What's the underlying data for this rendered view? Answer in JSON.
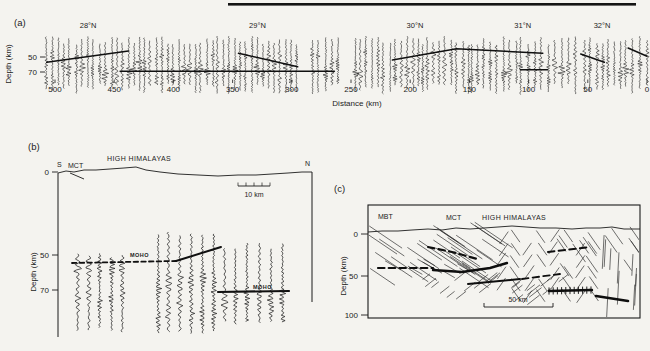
{
  "figure": {
    "background": "#f4f3ef",
    "ink": "#1b1b1b"
  },
  "panel_a": {
    "label": "(a)",
    "ylabel": "Depth  (km)",
    "xlabel": "Distance  (km)",
    "y_tick_labels": [
      "50",
      "70"
    ],
    "x_tick_labels": [
      "500",
      "450",
      "400",
      "350",
      "300",
      "250",
      "200",
      "150",
      "100",
      "50",
      "0"
    ],
    "latitude_labels": [
      "28°N",
      "29°N",
      "30°N",
      "31°N",
      "32°N"
    ]
  },
  "panel_b": {
    "label": "(b)",
    "end_south": "S",
    "end_north": "N",
    "fault_label": "MCT",
    "range_label": "HIGH HIMALAYAS",
    "moho_label_upper": "MOHO",
    "moho_label_lower": "MOHO",
    "scale_label": "10 km",
    "ylabel": "Depth  (km)",
    "y_tick_labels": [
      "0",
      "50",
      "70"
    ]
  },
  "panel_c": {
    "label": "(c)",
    "fault_label_1": "MBT",
    "fault_label_2": "MCT",
    "range_label": "HIGH HIMALAYAS",
    "scale_label": "50 km",
    "ylabel": "Depth  (km)",
    "y_tick_labels": [
      "0",
      "50",
      "100"
    ]
  },
  "chart_data": [
    {
      "id": "a",
      "type": "seismic-record-section",
      "xlabel": "Distance (km)",
      "ylabel": "Depth (km)",
      "x_range_km": [
        500,
        0
      ],
      "x_ticks_km": [
        500,
        450,
        400,
        350,
        300,
        250,
        200,
        150,
        100,
        50,
        0
      ],
      "y_ticks_km": [
        50,
        70
      ],
      "profile_bar_px": [
        228,
        636
      ],
      "latitude_marks": [
        {
          "label": "28°N",
          "distance_km": 472
        },
        {
          "label": "29°N",
          "distance_km": 329
        },
        {
          "label": "30°N",
          "distance_km": 196
        },
        {
          "label": "31°N",
          "distance_km": 105
        },
        {
          "label": "32°N",
          "distance_km": 38
        }
      ],
      "trace_groups_km": [
        [
          508,
          447
        ],
        [
          443,
          296
        ],
        [
          283,
          261
        ],
        [
          247,
          193
        ],
        [
          190,
          151
        ],
        [
          148,
          111
        ],
        [
          107,
          89
        ],
        [
          84,
          60
        ],
        [
          53,
          18
        ],
        [
          13,
          0
        ]
      ],
      "trace_spacing_km": 4.7,
      "moho_picks": [
        {
          "pts_km": [
            [
              507,
              57
            ],
            [
              438,
              42
            ]
          ]
        },
        {
          "pts_km": [
            [
              445,
              69
            ],
            [
              264,
              69
            ]
          ]
        },
        {
          "pts_km": [
            [
              345,
              45
            ],
            [
              295,
              63
            ]
          ]
        },
        {
          "pts_km": [
            [
              215,
              54
            ],
            [
              161,
              39
            ],
            [
              88,
              45
            ]
          ]
        },
        {
          "pts_km": [
            [
              107,
              67
            ],
            [
              84,
              67
            ]
          ]
        },
        {
          "pts_km": [
            [
              56,
              46
            ],
            [
              36,
              57
            ]
          ]
        },
        {
          "pts_km": [
            [
              16,
              38
            ],
            [
              0,
              49
            ]
          ]
        }
      ]
    },
    {
      "id": "b",
      "type": "seismic-record-section",
      "orientation": [
        "S",
        "N"
      ],
      "surface_labels": [
        "MCT",
        "HIGH HIMALAYAS"
      ],
      "ylabel": "Depth (km)",
      "y_ticks_km": [
        0,
        50,
        70
      ],
      "scale_bar_km": 10,
      "trace_columns_px": [
        [
          78,
          122,
          5
        ],
        [
          158,
          214,
          6
        ],
        [
          224,
          283,
          6
        ]
      ],
      "moho_lines_px": [
        {
          "style": "dashed",
          "w": 1.8,
          "pts": [
            [
              72,
              263
            ],
            [
              176,
              261
            ]
          ]
        },
        {
          "style": "solid",
          "w": 2.0,
          "pts": [
            [
              176,
              261
            ],
            [
              221,
              247
            ]
          ]
        },
        {
          "style": "solid",
          "w": 2.2,
          "pts": [
            [
              218,
              292
            ],
            [
              289,
              291
            ]
          ]
        }
      ]
    },
    {
      "id": "c",
      "type": "structural-section",
      "surface_labels": [
        "MBT",
        "MCT",
        "HIGH HIMALAYAS"
      ],
      "ylabel": "Depth (km)",
      "y_ticks_km": [
        0,
        50,
        100
      ],
      "scale_bar_km": 50,
      "fabric_regions": [
        {
          "type": "parallel",
          "x": [
            376,
            500
          ],
          "y": [
            233,
            278
          ],
          "angle": -34,
          "len": 40,
          "n": 30
        },
        {
          "type": "herringbone",
          "x": [
            496,
            600
          ],
          "y": [
            232,
            302
          ],
          "colw": 13,
          "len": 15,
          "angle": 55
        },
        {
          "type": "parallel",
          "x": [
            560,
            638
          ],
          "y": [
            233,
            270
          ],
          "angle": -55,
          "len": 18,
          "n": 14
        },
        {
          "type": "parallel",
          "x": [
            600,
            638
          ],
          "y": [
            250,
            305
          ],
          "angle": 87,
          "len": 26,
          "n": 10
        },
        {
          "type": "parallel",
          "x": [
            420,
            565
          ],
          "y": [
            274,
            300
          ],
          "angle": 38,
          "len": 13,
          "n": 26
        },
        {
          "type": "parallel",
          "x": [
            376,
            470
          ],
          "y": [
            262,
            276
          ],
          "angle": -30,
          "len": 18,
          "n": 8
        }
      ],
      "structural_lines_px": [
        {
          "style": "dashed",
          "w": 2.2,
          "pts": [
            [
              378,
              268
            ],
            [
              433,
              268
            ]
          ]
        },
        {
          "style": "solid",
          "w": 2.4,
          "pts": [
            [
              433,
              270
            ],
            [
              462,
              272
            ],
            [
              490,
              268
            ],
            [
              507,
              263
            ]
          ]
        },
        {
          "style": "dashed",
          "w": 2.2,
          "pts": [
            [
              428,
              247
            ],
            [
              452,
              252
            ],
            [
              477,
              259
            ]
          ]
        },
        {
          "style": "dashed",
          "w": 2.0,
          "pts": [
            [
              548,
              252
            ],
            [
              590,
              247
            ]
          ]
        },
        {
          "style": "solid",
          "w": 2.0,
          "pts": [
            [
              468,
              284
            ],
            [
              520,
              279
            ]
          ]
        },
        {
          "style": "dashed",
          "w": 1.8,
          "pts": [
            [
              522,
              279
            ],
            [
              560,
              274
            ]
          ]
        },
        {
          "style": "solid",
          "w": 2.4,
          "ticks": true,
          "pts": [
            [
              549,
              291
            ],
            [
              592,
              290
            ]
          ]
        },
        {
          "style": "solid",
          "w": 2.6,
          "pts": [
            [
              596,
              296
            ],
            [
              628,
              301
            ]
          ]
        }
      ]
    }
  ]
}
